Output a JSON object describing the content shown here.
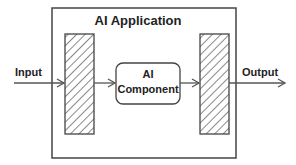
{
  "diagram": {
    "title": "AI Application",
    "input_label": "Input",
    "output_label": "Output",
    "component": {
      "line1": "AI",
      "line2": "Component"
    },
    "colors": {
      "stroke": "#444444",
      "text": "#222222",
      "background": "#ffffff"
    }
  }
}
